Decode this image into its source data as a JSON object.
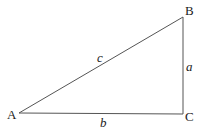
{
  "diagram": {
    "type": "right-triangle",
    "vertices": [
      {
        "name": "A",
        "x": 19,
        "y": 113,
        "lx": 7,
        "ly": 119
      },
      {
        "name": "B",
        "x": 183,
        "y": 17,
        "lx": 185,
        "ly": 15
      },
      {
        "name": "C",
        "x": 183,
        "y": 114,
        "lx": 185,
        "ly": 121
      }
    ],
    "sides": [
      {
        "name": "c",
        "from": "A",
        "to": "B",
        "lx": 97,
        "ly": 62
      },
      {
        "name": "a",
        "from": "B",
        "to": "C",
        "lx": 186,
        "ly": 71
      },
      {
        "name": "b",
        "from": "A",
        "to": "C",
        "lx": 100,
        "ly": 127
      }
    ],
    "line_color": "#555555"
  }
}
